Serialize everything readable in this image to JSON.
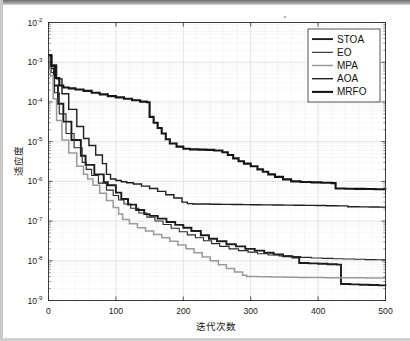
{
  "figure": {
    "background": "#ffffff",
    "frame_color": "#2b2b2b",
    "speck_label": "artifact-speck"
  },
  "axes": {
    "x_title": "迭代次数",
    "y_title": "适应度",
    "x_ticks": [
      "0",
      "100",
      "200",
      "300",
      "400",
      "500"
    ],
    "x_tick_values": [
      0,
      100,
      200,
      300,
      400,
      500
    ],
    "y_ticks": [
      "10-2",
      "10-3",
      "10-4",
      "10-5",
      "10-6",
      "10-7",
      "10-8",
      "10-9"
    ],
    "y_tick_mantissa": "10",
    "y_tick_exponents": [
      "-2",
      "-3",
      "-4",
      "-5",
      "-6",
      "-7",
      "-8",
      "-9"
    ]
  },
  "legend": {
    "position": "top-right",
    "items": [
      {
        "label": "STOA",
        "color": "#1c1c1c",
        "width": 1.9
      },
      {
        "label": "EO",
        "color": "#2a2a2a",
        "width": 1.1
      },
      {
        "label": "MPA",
        "color": "#9a9a9a",
        "width": 1.5
      },
      {
        "label": "AOA",
        "color": "#1f1f1f",
        "width": 1.4
      },
      {
        "label": "MRFO",
        "color": "#151515",
        "width": 2.1
      }
    ]
  },
  "chart_data": {
    "type": "line",
    "title": "",
    "xlabel": "迭代次数",
    "ylabel": "适应度",
    "xlim": [
      0,
      500
    ],
    "ylim": [
      1e-09,
      0.01
    ],
    "yscale": "log",
    "grid": true,
    "legend_position": "upper right",
    "series": [
      {
        "name": "STOA",
        "color": "#1c1c1c",
        "x": [
          0,
          3,
          8,
          14,
          22,
          34,
          48,
          55,
          68,
          82,
          88,
          100,
          108,
          118,
          130,
          142,
          150,
          162,
          175,
          188,
          200,
          212,
          226,
          238,
          250,
          264,
          278,
          292,
          306,
          320,
          334,
          348,
          362,
          372,
          386,
          400,
          414,
          428,
          434,
          448,
          462,
          476,
          490,
          500
        ],
        "y": [
          0.0015,
          0.0007,
          0.00026,
          9e-05,
          3.2e-05,
          1.1e-05,
          4.4e-06,
          2.6e-06,
          1.5e-06,
          9.5e-07,
          8e-07,
          5.2e-07,
          3.6e-07,
          2.6e-07,
          1.9e-07,
          1.5e-07,
          1.35e-07,
          1.15e-07,
          9.5e-08,
          8e-08,
          6.8e-08,
          5.6e-08,
          4.4e-08,
          3.6e-08,
          3.1e-08,
          2.6e-08,
          2.3e-08,
          2e-08,
          1.8e-08,
          1.6e-08,
          1.45e-08,
          1.3e-08,
          1.2e-08,
          8.8e-09,
          8.6e-09,
          8.4e-09,
          8.2e-09,
          8e-09,
          2.6e-09,
          2.55e-09,
          2.5e-09,
          2.45e-09,
          2.4e-09,
          2.35e-09
        ]
      },
      {
        "name": "EO",
        "color": "#2a2a2a",
        "x": [
          0,
          4,
          9,
          16,
          26,
          38,
          50,
          56,
          64,
          74,
          86,
          96,
          104,
          112,
          122,
          134,
          146,
          158,
          170,
          182,
          194,
          206,
          218,
          230,
          242,
          254,
          268,
          282,
          296,
          310,
          326,
          342,
          358,
          374,
          390,
          406,
          422,
          438,
          454,
          470,
          486,
          500
        ],
        "y": [
          0.0015,
          0.00055,
          0.00017,
          5e-05,
          1.6e-05,
          7e-06,
          3e-06,
          2e-06,
          1.4e-06,
          9e-07,
          6e-07,
          4.4e-07,
          3.4e-07,
          2.7e-07,
          2.1e-07,
          1.6e-07,
          1.25e-07,
          1e-07,
          8.2e-08,
          6.6e-08,
          5.4e-08,
          4.5e-08,
          3.8e-08,
          3.2e-08,
          2.7e-08,
          2.3e-08,
          2e-08,
          1.8e-08,
          1.65e-08,
          1.5e-08,
          1.4e-08,
          1.33e-08,
          1.27e-08,
          1.22e-08,
          1.18e-08,
          1.15e-08,
          1.13e-08,
          1.11e-08,
          1.09e-08,
          1.07e-08,
          1.06e-08,
          1.05e-08
        ]
      },
      {
        "name": "MPA",
        "color": "#9a9a9a",
        "x": [
          0,
          3,
          7,
          12,
          20,
          30,
          42,
          52,
          58,
          66,
          76,
          86,
          96,
          104,
          110,
          120,
          132,
          144,
          156,
          168,
          180,
          192,
          204,
          216,
          228,
          240,
          252,
          264,
          276,
          288,
          294,
          310,
          330,
          350,
          370,
          390,
          410,
          430,
          450,
          470,
          490,
          500
        ],
        "y": [
          0.0015,
          0.00045,
          0.00012,
          3.4e-05,
          1.1e-05,
          5.2e-06,
          2.4e-06,
          1.5e-06,
          1.15e-06,
          8e-07,
          5e-07,
          3.3e-07,
          2.2e-07,
          1.5e-07,
          1.1e-07,
          8.6e-08,
          6.8e-08,
          5.6e-08,
          4.6e-08,
          3.8e-08,
          3.1e-08,
          2.5e-08,
          2e-08,
          1.6e-08,
          1.25e-08,
          1e-08,
          8e-09,
          6.4e-09,
          5.2e-09,
          4.3e-09,
          4e-09,
          3.95e-09,
          3.9e-09,
          3.85e-09,
          3.8e-09,
          3.78e-09,
          3.76e-09,
          3.74e-09,
          3.72e-09,
          3.7e-09,
          3.68e-09,
          3.66e-09
        ]
      },
      {
        "name": "AOA",
        "color": "#1f1f1f",
        "x": [
          0,
          5,
          12,
          20,
          30,
          42,
          52,
          60,
          70,
          80,
          86,
          92,
          100,
          108,
          116,
          126,
          138,
          150,
          162,
          174,
          186,
          198,
          206,
          214,
          226,
          240,
          256,
          272,
          288,
          300,
          316,
          332,
          348,
          364,
          380,
          396,
          412,
          428,
          444,
          460,
          476,
          490,
          500
        ],
        "y": [
          0.0015,
          0.00085,
          0.00038,
          0.00016,
          6.5e-05,
          2.4e-05,
          1.2e-05,
          8e-06,
          4.6e-06,
          2.8e-06,
          1.5e-06,
          1.15e-06,
          1.05e-06,
          9.8e-07,
          9.2e-07,
          8.6e-07,
          7.6e-07,
          6.6e-07,
          5.6e-07,
          4.6e-07,
          3.8e-07,
          3e-07,
          2.75e-07,
          2.7e-07,
          2.68e-07,
          2.66e-07,
          2.64e-07,
          2.62e-07,
          2.6e-07,
          2.58e-07,
          2.56e-07,
          2.54e-07,
          2.52e-07,
          2.5e-07,
          2.48e-07,
          2.46e-07,
          2.44e-07,
          2.42e-07,
          2.3e-07,
          2.28e-07,
          2.26e-07,
          2.24e-07,
          2.22e-07
        ]
      },
      {
        "name": "MRFO",
        "color": "#151515",
        "x": [
          0,
          4,
          10,
          16,
          22,
          30,
          40,
          52,
          64,
          76,
          88,
          100,
          112,
          124,
          136,
          146,
          150,
          156,
          162,
          168,
          174,
          180,
          190,
          200,
          210,
          222,
          234,
          246,
          258,
          266,
          274,
          282,
          290,
          300,
          310,
          318,
          326,
          336,
          348,
          360,
          374,
          390,
          405,
          420,
          426,
          440,
          455,
          470,
          485,
          500
        ],
        "y": [
          0.0015,
          0.0008,
          0.0004,
          0.00026,
          0.00023,
          0.00022,
          0.000205,
          0.00019,
          0.00017,
          0.000155,
          0.00014,
          0.00013,
          0.00012,
          0.00011,
          0.000102,
          9.8e-05,
          4.2e-05,
          3e-05,
          2.2e-05,
          1.6e-05,
          1.15e-05,
          9e-06,
          7.5e-06,
          6.6e-06,
          6.4e-06,
          6.3e-06,
          6.2e-06,
          6e-06,
          5.4e-06,
          4.6e-06,
          3.8e-06,
          3.2e-06,
          2.8e-06,
          2.4e-06,
          2e-06,
          1.75e-06,
          1.5e-06,
          1.3e-06,
          1.12e-06,
          1e-06,
          9.6e-07,
          9.4e-07,
          9.2e-07,
          9e-07,
          6.6e-07,
          6.5e-07,
          6.45e-07,
          6.4e-07,
          6.35e-07,
          6.3e-07
        ]
      }
    ]
  }
}
